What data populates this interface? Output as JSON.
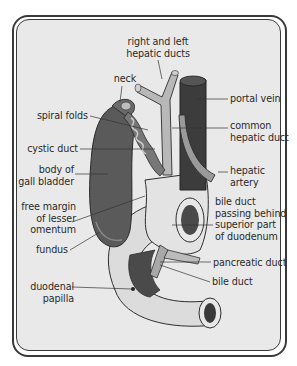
{
  "figure": {
    "colors": {
      "background": "#e9e9e9",
      "frame": "#3a3a3a",
      "gall_bladder": "#5a5a5a",
      "portal_vein": "#3c3c3c",
      "ducts": "#b8b8b8",
      "duodenum": "#dcdcdc",
      "leader": "#333333"
    },
    "labels": [
      {
        "id": "right-and-left-hepatic-ducts",
        "text": "right and left\nhepatic ducts",
        "x": 118,
        "y": 36,
        "w": 80,
        "align": "c",
        "line": [
          [
            158,
            60
          ],
          [
            162,
            79
          ]
        ]
      },
      {
        "id": "neck",
        "text": "neck",
        "x": 113,
        "y": 73,
        "w": 24,
        "align": "c",
        "line": [
          [
            122,
            86
          ],
          [
            120,
            102
          ]
        ]
      },
      {
        "id": "portal-vein",
        "text": "portal vein",
        "x": 230,
        "y": 93,
        "w": 60,
        "align": "l",
        "line": [
          [
            228,
            99
          ],
          [
            196,
            99
          ]
        ]
      },
      {
        "id": "spiral-folds",
        "text": "spiral folds",
        "x": 20,
        "y": 110,
        "w": 68,
        "align": "r",
        "line": [
          [
            90,
            116
          ],
          [
            148,
            130
          ]
        ]
      },
      {
        "id": "common-hepatic-duct",
        "text": "common\nhepatic duct",
        "x": 230,
        "y": 120,
        "w": 62,
        "align": "l",
        "line": [
          [
            228,
            128
          ],
          [
            172,
            128
          ]
        ]
      },
      {
        "id": "cystic-duct",
        "text": "cystic duct",
        "x": 20,
        "y": 143,
        "w": 58,
        "align": "r",
        "line": [
          [
            80,
            149
          ],
          [
            155,
            149
          ]
        ]
      },
      {
        "id": "body-of-gall-bladder",
        "text": "body of\ngall bladder",
        "x": 16,
        "y": 164,
        "w": 58,
        "align": "r",
        "line": [
          [
            75,
            174
          ],
          [
            108,
            174
          ]
        ]
      },
      {
        "id": "hepatic-artery",
        "text": "hepatic\nartery",
        "x": 230,
        "y": 165,
        "w": 50,
        "align": "l",
        "line": [
          [
            228,
            172
          ],
          [
            218,
            172
          ]
        ]
      },
      {
        "id": "free-margin-of-lesser-omentum",
        "text": "free margin\nof lesser\nomentum",
        "x": 16,
        "y": 201,
        "w": 60,
        "align": "r",
        "line": [
          [
            72,
            222
          ],
          [
            145,
            196
          ]
        ]
      },
      {
        "id": "bile-duct-passing-behind-superior-part-of-duodenum",
        "text": "bile duct\npassing behind\nsuperior part\nof duodenum",
        "x": 215,
        "y": 196,
        "w": 80,
        "align": "l",
        "line": [
          [
            213,
            225
          ],
          [
            172,
            225
          ]
        ]
      },
      {
        "id": "fundus",
        "text": "fundus",
        "x": 28,
        "y": 244,
        "w": 40,
        "align": "r",
        "line": [
          [
            70,
            250
          ],
          [
            100,
            232
          ]
        ]
      },
      {
        "id": "pancreatic-duct",
        "text": "pancreatic duct",
        "x": 213,
        "y": 257,
        "w": 82,
        "align": "l",
        "line": [
          [
            211,
            262
          ],
          [
            160,
            262
          ]
        ]
      },
      {
        "id": "duodenal-papilla",
        "text": "duodenal\npapilla",
        "x": 20,
        "y": 281,
        "w": 54,
        "align": "r",
        "line": [
          [
            72,
            287
          ],
          [
            132,
            289
          ]
        ]
      },
      {
        "id": "bile-duct",
        "text": "bile duct",
        "x": 212,
        "y": 276,
        "w": 56,
        "align": "l",
        "line": [
          [
            210,
            282
          ],
          [
            160,
            265
          ]
        ]
      }
    ]
  }
}
